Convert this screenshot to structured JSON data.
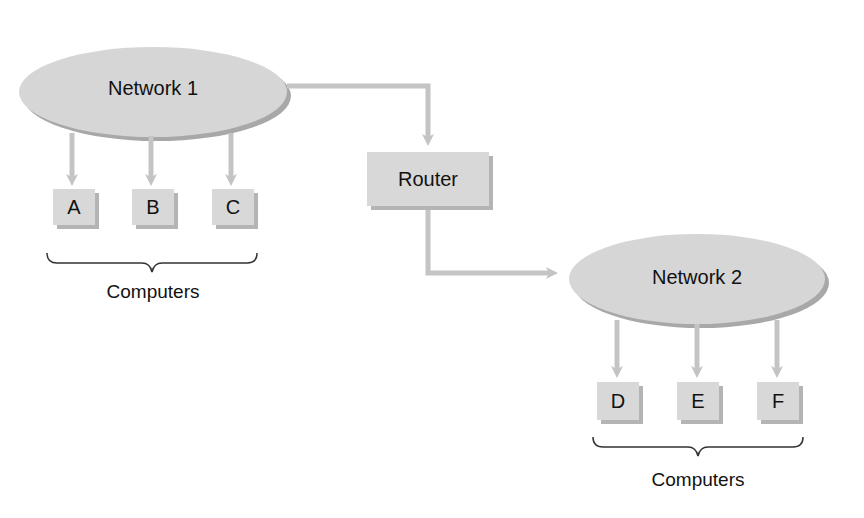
{
  "diagram": {
    "network1": {
      "label": "Network 1"
    },
    "network2": {
      "label": "Network 2"
    },
    "router": {
      "label": "Router"
    },
    "group1": {
      "computers": [
        {
          "label": "A"
        },
        {
          "label": "B"
        },
        {
          "label": "C"
        }
      ],
      "caption": "Computers"
    },
    "group2": {
      "computers": [
        {
          "label": "D"
        },
        {
          "label": "E"
        },
        {
          "label": "F"
        }
      ],
      "caption": "Computers"
    },
    "colors": {
      "node_fill": "#d6d6d6",
      "node_shadow": "#b0b0b0",
      "arrow": "#c4c4c4",
      "text": "#111111"
    }
  }
}
